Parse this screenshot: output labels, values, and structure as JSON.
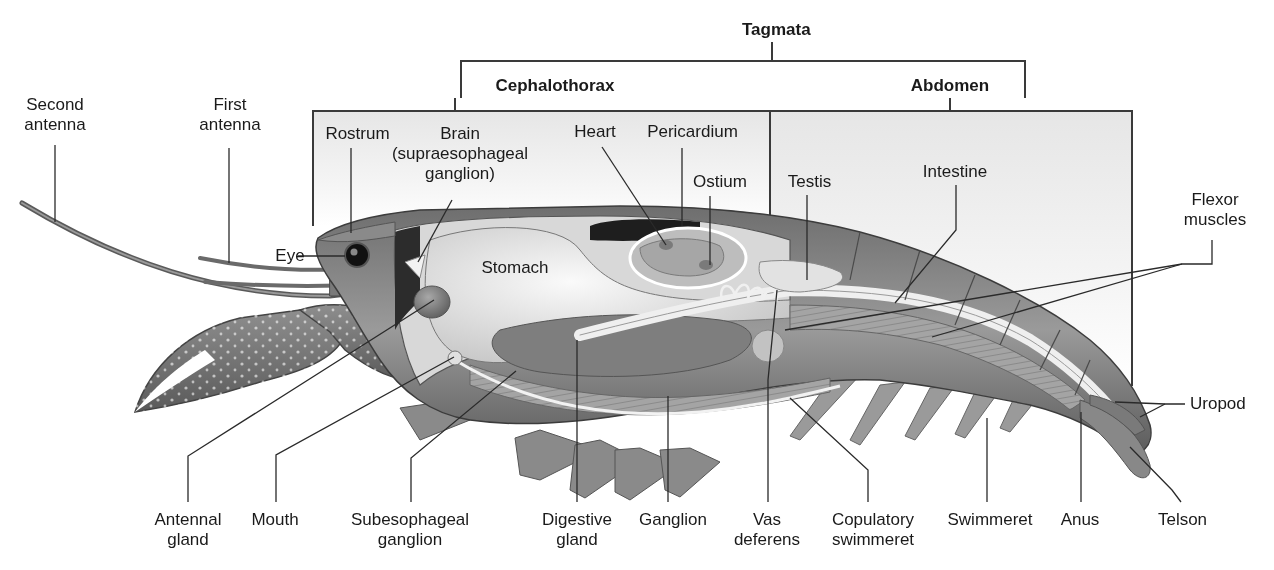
{
  "diagram": {
    "colors": {
      "line": "#3a3a3a",
      "region_fill": "#ececec",
      "body_dark": "#5a5a5a",
      "body_mid": "#8c8c8c",
      "body_light": "#c8c8c8",
      "organ_light": "#e4e4e4"
    },
    "groups": {
      "tagmata": "Tagmata",
      "cephalothorax": "Cephalothorax",
      "abdomen": "Abdomen"
    },
    "top_labels": {
      "second_antenna": [
        "Second",
        "antenna"
      ],
      "first_antenna": [
        "First",
        "antenna"
      ],
      "rostrum": "Rostrum",
      "brain": [
        "Brain",
        "(supraesophageal",
        "ganglion)"
      ],
      "heart": "Heart",
      "pericardium": "Pericardium",
      "ostium": "Ostium",
      "testis": "Testis",
      "intestine": "Intestine",
      "flexor_muscles": [
        "Flexor",
        "muscles"
      ],
      "eye": "Eye",
      "stomach": "Stomach",
      "uropod": "Uropod"
    },
    "bottom_labels": [
      {
        "key": "antennal_gland",
        "lines": [
          "Antennal",
          "gland"
        ]
      },
      {
        "key": "mouth",
        "lines": [
          "Mouth"
        ]
      },
      {
        "key": "subesophageal_ganglion",
        "lines": [
          "Subesophageal",
          "ganglion"
        ]
      },
      {
        "key": "digestive_gland",
        "lines": [
          "Digestive",
          "gland"
        ]
      },
      {
        "key": "ganglion",
        "lines": [
          "Ganglion"
        ]
      },
      {
        "key": "vas_deferens",
        "lines": [
          "Vas",
          "deferens"
        ]
      },
      {
        "key": "copulatory_swimmeret",
        "lines": [
          "Copulatory",
          "swimmeret"
        ]
      },
      {
        "key": "swimmeret",
        "lines": [
          "Swimmeret"
        ]
      },
      {
        "key": "anus",
        "lines": [
          "Anus"
        ]
      },
      {
        "key": "telson",
        "lines": [
          "Telson"
        ]
      }
    ]
  }
}
